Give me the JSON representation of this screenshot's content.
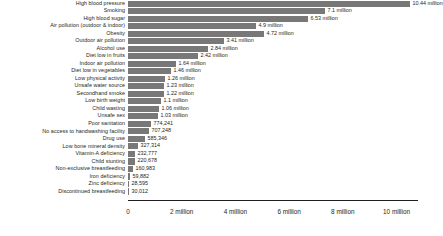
{
  "chart_data": {
    "type": "bar",
    "orientation": "horizontal",
    "title": "",
    "subtitle": "",
    "xlabel": "",
    "ylabel": "",
    "grid": false,
    "legend": false,
    "xlim": [
      0,
      10800000
    ],
    "xticks": [
      0,
      2000000,
      4000000,
      6000000,
      8000000,
      10000000
    ],
    "xtick_labels": [
      "0",
      "2 million",
      "4 million",
      "6 million",
      "8 million",
      "10 million"
    ],
    "bar_color": "#787878",
    "categories": [
      "High blood pressure",
      "Smoking",
      "High blood sugar",
      "Air pollution (outdoor & indoor)",
      "Obesity",
      "Outdoor air pollution",
      "Alcohol use",
      "Diet low in fruits",
      "Indoor air pollution",
      "Diet low in vegetables",
      "Low physical activity",
      "Unsafe water source",
      "Secondhand smoke",
      "Low birth weight",
      "Child wasting",
      "Unsafe sex",
      "Poor sanitation",
      "No access to handwashing facility",
      "Drug use",
      "Low bone mineral density",
      "Vitamin-A deficiency",
      "Child stunting",
      "Non-exclusive breastfeeding",
      "Iron deficiency",
      "Zinc deficiency",
      "Discontinued breastfeeding"
    ],
    "values": [
      10440000,
      7100000,
      6530000,
      4900000,
      4720000,
      3410000,
      2840000,
      2420000,
      1640000,
      1460000,
      1260000,
      1230000,
      1220000,
      1100000,
      1060000,
      1030000,
      774241,
      707248,
      585346,
      327314,
      232777,
      220678,
      160983,
      59882,
      28595,
      30012
    ],
    "value_labels": [
      "10.44 million",
      "7.1 million",
      "6.53 million",
      "4.9 million",
      "4.72 million",
      "3.41 million",
      "2.84 million",
      "2.42 million",
      "1.64 million",
      "1.46 million",
      "1.26 million",
      "1.23 million",
      "1.22 million",
      "1.1 million",
      "1.06 million",
      "1.03 million",
      "774,241",
      "707,248",
      "585,346",
      "327,314",
      "232,777",
      "220,678",
      "160,983",
      "59,882",
      "28,595",
      "30,012"
    ],
    "bar_pixel_widths": [
      282,
      197,
      180,
      128,
      136,
      96,
      80,
      70,
      48,
      43,
      37,
      36,
      36,
      33,
      31,
      30,
      23,
      21,
      17,
      10,
      7,
      7,
      5,
      2,
      1,
      1
    ]
  }
}
